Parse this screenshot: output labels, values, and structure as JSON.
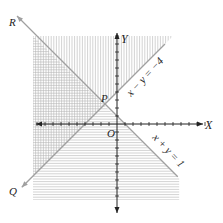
{
  "chart_data": {
    "type": "diagram",
    "title": "",
    "axes": {
      "x_label": "X",
      "y_label": "Y",
      "origin_label": "O",
      "xlim": [
        -10,
        11
      ],
      "ylim": [
        -9,
        11
      ],
      "tick_step": 1
    },
    "lines": [
      {
        "name": "x+y=1",
        "label": "x + y = 1",
        "a": 1,
        "b": 1,
        "c": 1,
        "end_labels": [
          "R"
        ],
        "from_x": -12.5,
        "to_x": 7.6
      },
      {
        "name": "x-y=-4",
        "label": "x − y = −4",
        "a": 1,
        "b": -1,
        "c": -4,
        "end_labels": [
          "Q"
        ],
        "from_x": -11.9,
        "to_x": 6
      }
    ],
    "points": [
      {
        "name": "P",
        "x": -1.5,
        "y": 2.5
      }
    ],
    "shading": {
      "x-y<=-4": "vertical hatch",
      "x+y<=1": "horizontal hatch",
      "region_bounds": {
        "xmin": -10.5,
        "xmax": 7.8,
        "ymin": -9.5,
        "ymax": 11
      }
    }
  },
  "labels": {
    "x_axis": "X",
    "y_axis": "Y",
    "origin": "O",
    "point_p": "P",
    "point_q": "Q",
    "point_r": "R",
    "line1": "x + y = 1",
    "line2": "x − y = −4"
  },
  "colors": {
    "line": "#9a9a9a",
    "axis": "#222222",
    "hatch": "#b5b5b5"
  }
}
